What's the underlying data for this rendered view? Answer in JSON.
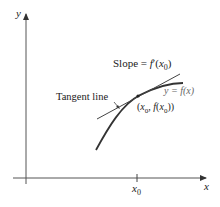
{
  "diagram": {
    "axes": {
      "x_label": "x",
      "y_label": "y",
      "x_tick_label": {
        "base": "x",
        "sub": "0"
      }
    },
    "labels": {
      "slope_prefix": "Slope = ",
      "slope_func": "f",
      "slope_prime": "′",
      "slope_open": "(",
      "slope_var": "x",
      "slope_sub": "0",
      "slope_close": ")",
      "curve_label": "y = f(x)",
      "point_open": "(",
      "point_x": "x",
      "point_sub1": "0",
      "point_comma": ", ",
      "point_f": "f",
      "point_paren": "(",
      "point_x2": "x",
      "point_sub2": "0",
      "point_close": "))",
      "tangent_label": "Tangent line"
    },
    "colors": {
      "axis": "#555555",
      "curve": "#333333",
      "tangent": "#444444",
      "text": "#222222"
    }
  }
}
